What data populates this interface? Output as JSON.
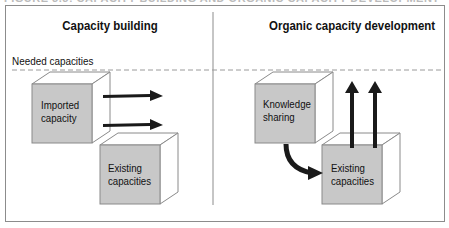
{
  "figure": {
    "caption": "FIGURE 3.3: CAPACITY BUILDING AND ORGANIC CAPACITY DEVELOPMENT"
  },
  "left_panel": {
    "title": "Capacity building",
    "threshold_label": "Needed capacities",
    "cubes": [
      {
        "line1": "Imported",
        "line2": "capacity"
      },
      {
        "line1": "Existing",
        "line2": "capacities"
      }
    ],
    "arrows": [
      "right",
      "right"
    ]
  },
  "right_panel": {
    "title": "Organic capacity development",
    "cubes": [
      {
        "line1": "Knowledge",
        "line2": "sharing"
      },
      {
        "line1": "Existing",
        "line2": "capacities"
      }
    ],
    "arrows": [
      "up",
      "up",
      "curved-down-right"
    ]
  },
  "colors": {
    "cube_front": "#c8c8c8",
    "cube_edge": "#8a8a8a",
    "arrow": "#1a1a1a",
    "frame": "#8c8c8c",
    "dashed_line": "#9a9a9a"
  }
}
